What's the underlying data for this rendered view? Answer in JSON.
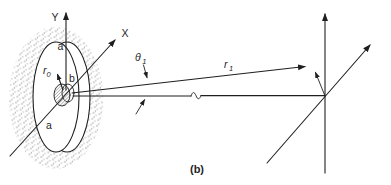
{
  "figure": {
    "caption": "(b)",
    "colors": {
      "ink": "#1f1f1f",
      "stipple": "#8d8d8d",
      "hatch": "#4a4a4a",
      "paper": "#ffffff"
    },
    "aperture": {
      "axis_y_label": "Y",
      "axis_x_label": "X",
      "outer_radius_label_top": "a",
      "outer_radius_label_bottom": "a",
      "inner_radius_label": "b",
      "r0_label": {
        "base": "r",
        "sub": "0"
      }
    },
    "propagation": {
      "theta1_label": {
        "base": "θ",
        "sub": "1"
      },
      "r1_label": {
        "base": "r",
        "sub": "1"
      },
      "wave_break_symbol": "∿"
    }
  }
}
